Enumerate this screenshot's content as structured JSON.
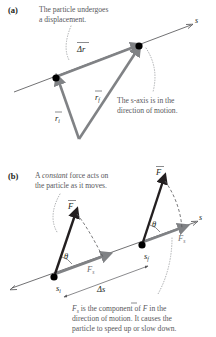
{
  "figure": {
    "panel_a": {
      "label": "(a)",
      "caption_top_line1": "The particle undergoes",
      "caption_top_line2": "a displacement.",
      "caption_right_line1": "The s-axis is in the",
      "caption_right_line2": "direction of motion.",
      "axis_label": "s",
      "vector_displacement": "Δr",
      "vector_initial": "r",
      "vector_initial_sub": "i",
      "vector_final": "r",
      "vector_final_sub": "f"
    },
    "panel_b": {
      "label": "(b)",
      "caption_top_pre": "A ",
      "caption_top_italic": "constant",
      "caption_top_post": " force acts on",
      "caption_top_line2": "the particle as it moves.",
      "caption_bottom_line1_a": "F",
      "caption_bottom_line1_sub": "s",
      "caption_bottom_line1_b": " is the component of ",
      "caption_bottom_line1_c": "F",
      "caption_bottom_line1_d": " in the",
      "caption_bottom_line2": "direction of motion. It causes the",
      "caption_bottom_line3": "particle to speed up or slow down.",
      "axis_label": "s",
      "force_label": "F",
      "angle_label": "θ",
      "component_label": "F",
      "component_sub": "s",
      "pos_initial": "s",
      "pos_initial_sub": "i",
      "pos_final": "s",
      "pos_final_sub": "f",
      "displacement_label": "Δs"
    }
  },
  "colors": {
    "text": "#231f20",
    "caption": "#58585b",
    "gray_vector": "#808285",
    "black_vector": "#231f20",
    "axis": "#4d4d4f",
    "dotted_leader": "#a7a9ac"
  }
}
